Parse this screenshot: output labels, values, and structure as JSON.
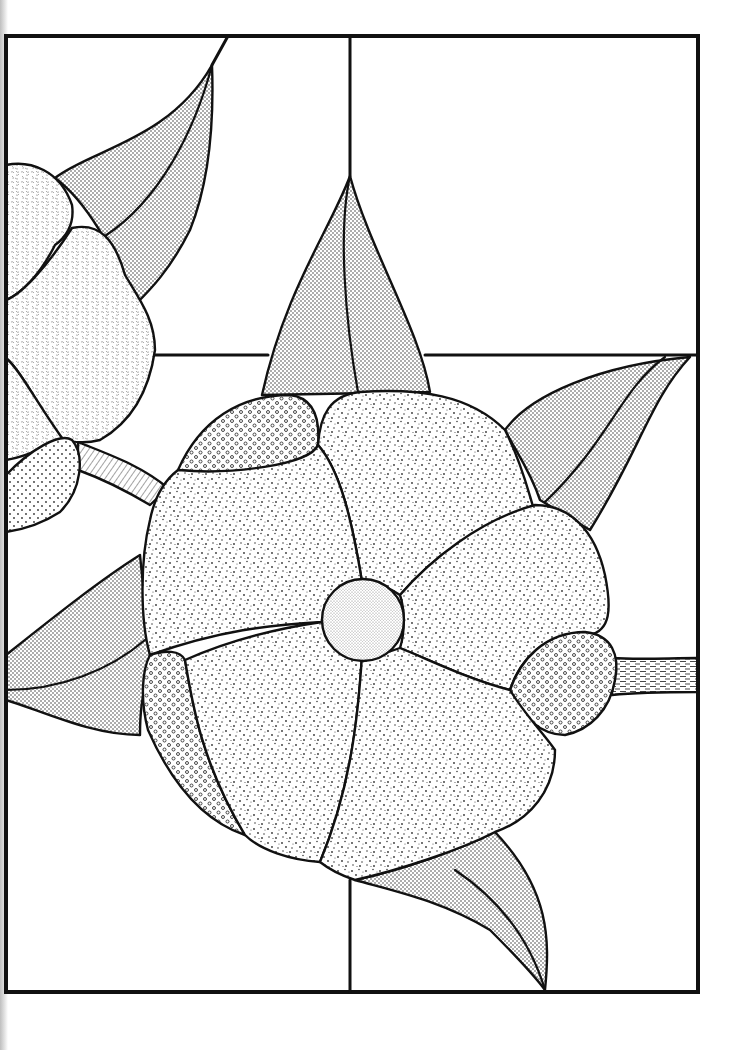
{
  "page": {
    "width": 747,
    "height": 1050
  },
  "colors": {
    "background": "#ffffff",
    "lead_line": "#111111",
    "stipple": "#444444"
  },
  "frame": {
    "x": 6,
    "y": 36,
    "width": 692,
    "height": 956,
    "vertical_divider_x": 350,
    "horizontal_divider_y": 355
  },
  "textures": {
    "leaf": "fine-dense-stipple",
    "petal": "coarse-scattered-speckle",
    "petal_accent": "open-circles",
    "center": "fine-light-stipple",
    "left_flower": "worm-texture",
    "left_bud": "sparse-dots",
    "stem_left": "diagonal-hatch",
    "stem_right": "horizontal-dash"
  }
}
